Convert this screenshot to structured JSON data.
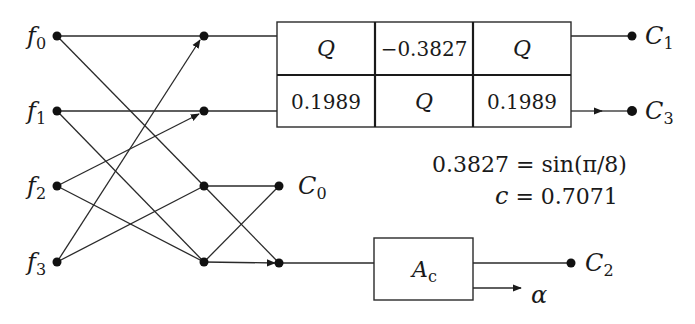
{
  "diagram": {
    "type": "signal-flow-graph",
    "colors": {
      "ink": "#1a1a1a",
      "background": "#ffffff"
    },
    "inputs": [
      {
        "id": "f0",
        "label": "f",
        "sub": "0",
        "x": 57,
        "y": 36
      },
      {
        "id": "f1",
        "label": "f",
        "sub": "1",
        "x": 57,
        "y": 111
      },
      {
        "id": "f2",
        "label": "f",
        "sub": "2",
        "x": 57,
        "y": 186
      },
      {
        "id": "f3",
        "label": "f",
        "sub": "3",
        "x": 57,
        "y": 262
      }
    ],
    "stage1_nodes": [
      {
        "id": "s0",
        "x": 204,
        "y": 36
      },
      {
        "id": "s1",
        "x": 204,
        "y": 111
      },
      {
        "id": "s2",
        "x": 204,
        "y": 186
      },
      {
        "id": "s3",
        "x": 204,
        "y": 262
      }
    ],
    "stage2_nodes": [
      {
        "id": "t0",
        "x": 279,
        "y": 186
      },
      {
        "id": "t1",
        "x": 279,
        "y": 263
      }
    ],
    "rotation_grid": {
      "rows": [
        [
          "Q",
          "−0.3827",
          "Q"
        ],
        [
          "0.1989",
          "Q",
          "0.1989"
        ]
      ],
      "cell_kinds": [
        [
          "calQ",
          "number",
          "calQ"
        ],
        [
          "number",
          "calQ",
          "number"
        ]
      ]
    },
    "scaling_block": {
      "label": "A",
      "sub": "c"
    },
    "outputs": [
      {
        "id": "C0",
        "label": "C",
        "sub": "0"
      },
      {
        "id": "C1",
        "label": "C",
        "sub": "1"
      },
      {
        "id": "C2",
        "label": "C",
        "sub": "2"
      },
      {
        "id": "C3",
        "label": "C",
        "sub": "3"
      }
    ],
    "alpha_label": "α",
    "notes": {
      "line1": "0.3827 = sin(π/8)",
      "line2_var": "c",
      "line2_rest": " = 0.7071"
    }
  }
}
